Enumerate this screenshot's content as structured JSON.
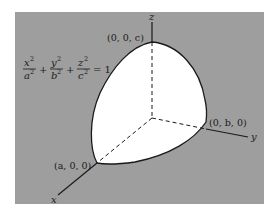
{
  "diagram": {
    "equation": {
      "terms": [
        {
          "num": "x",
          "den": "a"
        },
        {
          "num": "y",
          "den": "b"
        },
        {
          "num": "z",
          "den": "c"
        }
      ],
      "exponent": "2",
      "plus": "+",
      "equals": "= 1"
    },
    "axes": {
      "x_label": "x",
      "y_label": "y",
      "z_label": "z"
    },
    "points": {
      "x_intercept": "(a, 0, 0)",
      "y_intercept": "(0, b, 0)",
      "z_intercept": "(0, 0, c)"
    },
    "colors": {
      "background": "#9e9e9e",
      "surface": "#ffffff",
      "outline": "#1a1a1a",
      "page": "#ffffff"
    }
  }
}
